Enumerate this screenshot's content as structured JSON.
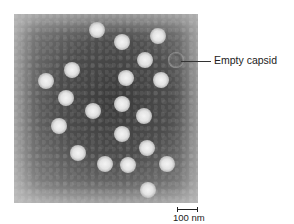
{
  "figure": {
    "type": "electron micrograph (negative stain) of virus particles",
    "annotation": {
      "label": "Empty capsid"
    },
    "scale_bar": {
      "label": "100 nm"
    },
    "particles": [
      {
        "x": 97,
        "y": 30
      },
      {
        "x": 122,
        "y": 42
      },
      {
        "x": 158,
        "y": 36
      },
      {
        "x": 145,
        "y": 60
      },
      {
        "x": 72,
        "y": 70
      },
      {
        "x": 46,
        "y": 81
      },
      {
        "x": 126,
        "y": 78
      },
      {
        "x": 161,
        "y": 80
      },
      {
        "x": 66,
        "y": 98
      },
      {
        "x": 122,
        "y": 104
      },
      {
        "x": 93,
        "y": 111
      },
      {
        "x": 144,
        "y": 116
      },
      {
        "x": 59,
        "y": 126
      },
      {
        "x": 122,
        "y": 134
      },
      {
        "x": 147,
        "y": 148
      },
      {
        "x": 78,
        "y": 153
      },
      {
        "x": 105,
        "y": 164
      },
      {
        "x": 128,
        "y": 165
      },
      {
        "x": 167,
        "y": 164
      },
      {
        "x": 148,
        "y": 190
      }
    ],
    "empty_capsid_position": {
      "x": 176,
      "y": 60
    }
  }
}
